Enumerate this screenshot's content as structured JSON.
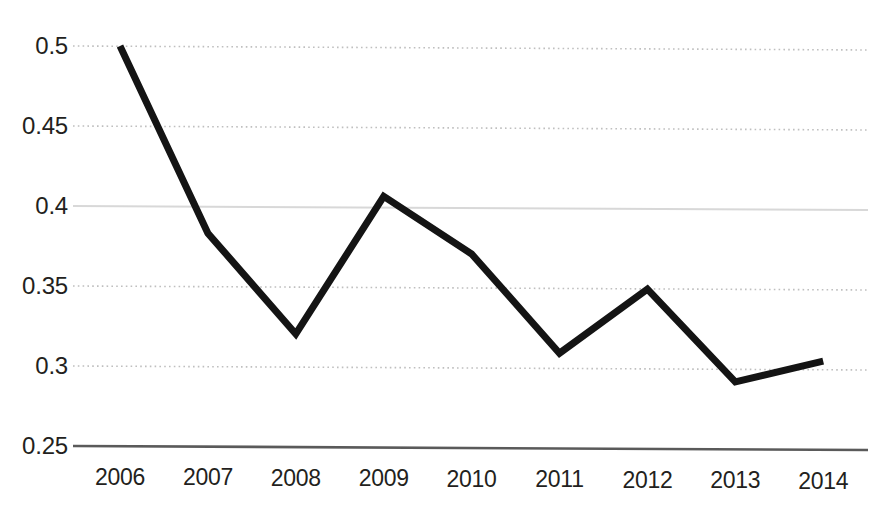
{
  "chart_data": {
    "type": "line",
    "title": "",
    "subtitle": "",
    "xlabel": "",
    "ylabel": "",
    "categories": [
      "2006",
      "2007",
      "2008",
      "2009",
      "2010",
      "2011",
      "2012",
      "2013",
      "2014"
    ],
    "values": [
      0.5,
      0.383,
      0.32,
      0.406,
      0.37,
      0.308,
      0.348,
      0.29,
      0.303
    ],
    "series": [
      {
        "name": "",
        "values": [
          0.5,
          0.383,
          0.32,
          0.406,
          0.37,
          0.308,
          0.348,
          0.29,
          0.303
        ],
        "color": "#141414",
        "line_width": 7,
        "markers": false
      }
    ],
    "ylim": [
      0.25,
      0.5
    ],
    "y_ticks": [
      0.5,
      0.45,
      0.4,
      0.35,
      0.3,
      0.25
    ],
    "y_tick_labels": [
      "0.5",
      "0.45",
      "0.4",
      "0.35",
      "0.3",
      "0.25"
    ],
    "x_ticks": [
      "2006",
      "2007",
      "2008",
      "2009",
      "2010",
      "2011",
      "2012",
      "2013",
      "2014"
    ],
    "grid": {
      "horizontal": true,
      "vertical": false,
      "style": "dotted",
      "color": "#bfbfbf",
      "solid_lines": [
        0.4,
        0.25
      ]
    },
    "legend": {
      "visible": false,
      "position": "none",
      "entries": []
    },
    "annotations": [],
    "axis": {
      "baseline_value": 0.25,
      "baseline_color": "#5a5a5a",
      "left_spine": false,
      "right_spine": false,
      "top_spine": false
    }
  }
}
